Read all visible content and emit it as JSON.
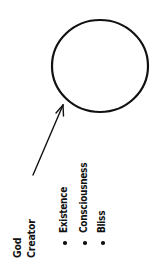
{
  "diagram": {
    "circle": {
      "cx": 100,
      "cy": 66,
      "rx": 48,
      "ry": 46,
      "stroke": "#111111",
      "stroke_width": 2.2
    },
    "arrow": {
      "from": [
        33,
        175
      ],
      "to": [
        63,
        105
      ],
      "stroke": "#111111"
    },
    "labels": {
      "god": "God",
      "creator": "Creator"
    },
    "attributes": [
      {
        "label": "Existence"
      },
      {
        "label": "Consciousness"
      },
      {
        "label": "Bliss"
      }
    ]
  }
}
